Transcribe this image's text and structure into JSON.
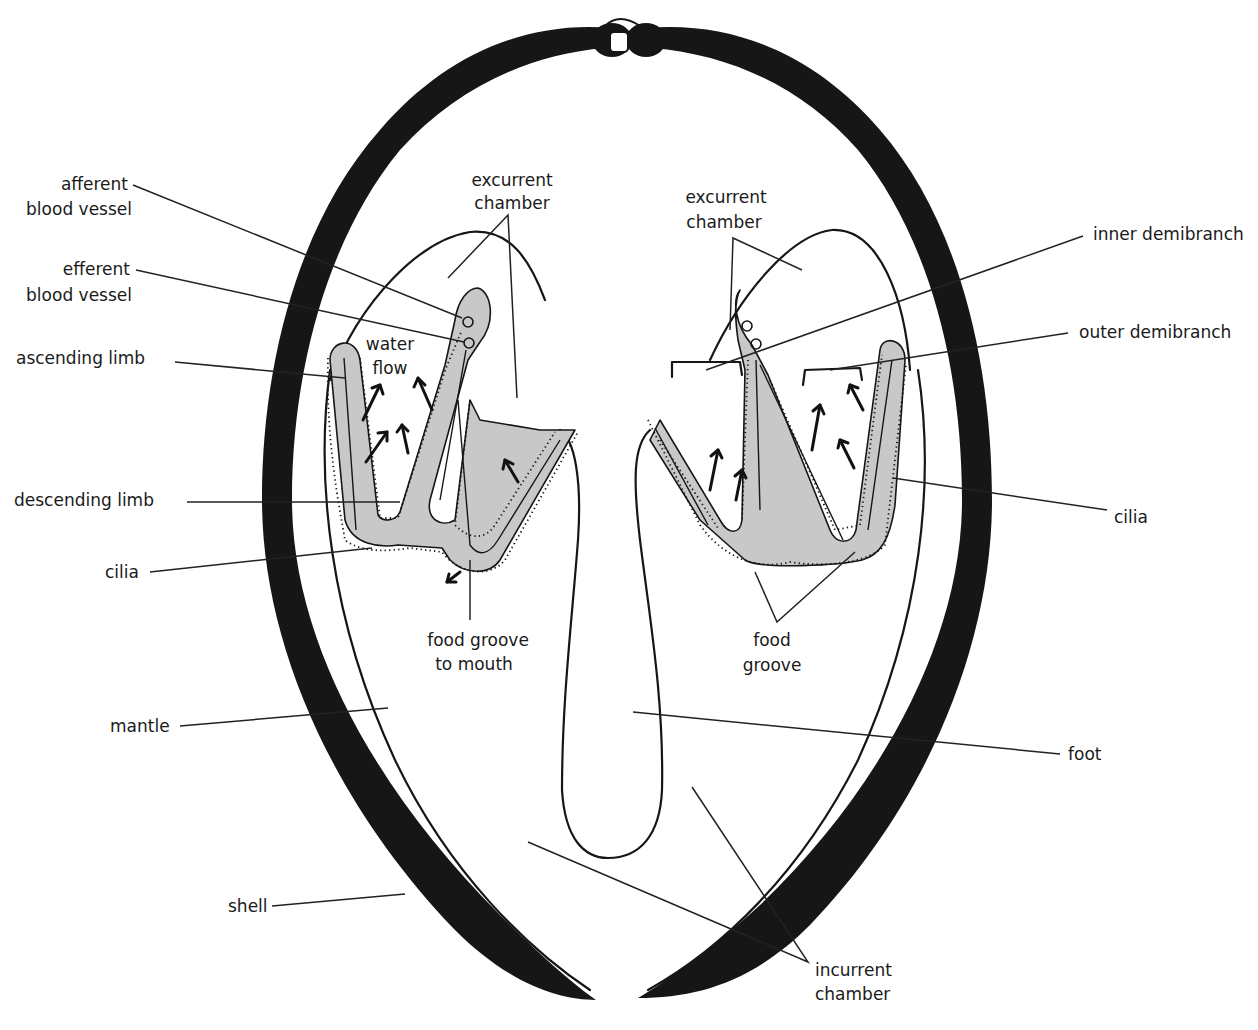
{
  "figure": {
    "colors": {
      "shell": "#161616",
      "gill_fill": "#c8c8c8",
      "background": "#ffffff",
      "text": "#1a1a1a"
    }
  },
  "labels": {
    "afferent_blood_vessel": {
      "line1": "afferent",
      "line2": "blood vessel"
    },
    "efferent_blood_vessel": {
      "line1": "efferent",
      "line2": "blood vessel"
    },
    "ascending_limb": "ascending limb",
    "descending_limb": "descending limb",
    "cilia_left": "cilia",
    "mantle": "mantle",
    "shell": "shell",
    "water_flow": {
      "line1": "water",
      "line2": "flow"
    },
    "excurrent_chamber_left": {
      "line1": "excurrent",
      "line2": "chamber"
    },
    "excurrent_chamber_right": {
      "line1": "excurrent",
      "line2": "chamber"
    },
    "food_groove_to_mouth": {
      "line1": "food groove",
      "line2": "to mouth"
    },
    "food_groove": {
      "line1": "food",
      "line2": "groove"
    },
    "inner_demibranch": "inner demibranch",
    "outer_demibranch": "outer demibranch",
    "cilia_right": "cilia",
    "foot": "foot",
    "incurrent_chamber": {
      "line1": "incurrent",
      "line2": "chamber"
    }
  }
}
